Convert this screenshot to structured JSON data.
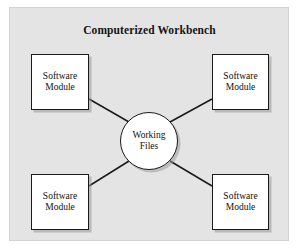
{
  "diagram": {
    "title": "Computerized Workbench",
    "type": "hub-and-spoke",
    "background_color": "#e4e4e4",
    "node_fill_color": "#ffffff",
    "node_border_color": "#1a1a1a",
    "hub": {
      "label": "Working\nFiles",
      "shape": "circle"
    },
    "modules": [
      {
        "id": "top-left",
        "label": "Software\nModule",
        "shape": "rectangle"
      },
      {
        "id": "top-right",
        "label": "Software\nModule",
        "shape": "rectangle"
      },
      {
        "id": "bottom-left",
        "label": "Software\nModule",
        "shape": "rectangle"
      },
      {
        "id": "bottom-right",
        "label": "Software\nModule",
        "shape": "rectangle"
      }
    ],
    "connectors": [
      {
        "from": "top-left",
        "to": "hub",
        "style": "solid-line"
      },
      {
        "from": "top-right",
        "to": "hub",
        "style": "solid-line"
      },
      {
        "from": "bottom-left",
        "to": "hub",
        "style": "solid-line"
      },
      {
        "from": "bottom-right",
        "to": "hub",
        "style": "solid-line"
      }
    ]
  }
}
